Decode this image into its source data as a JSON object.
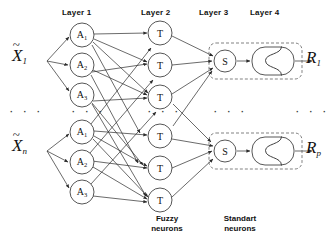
{
  "diagram": {
    "layer_labels": [
      {
        "id": "layer-1",
        "text": "Layer 1",
        "x": 62,
        "y": 8
      },
      {
        "id": "layer-2",
        "text": "Layer 2",
        "x": 141,
        "y": 8
      },
      {
        "id": "layer-3",
        "text": "Layer 3",
        "x": 199,
        "y": 8
      },
      {
        "id": "layer-4",
        "text": "Layer 4",
        "x": 250,
        "y": 8
      }
    ],
    "group_captions": [
      {
        "id": "fuzzy-neurons",
        "line1": "Fuzzy",
        "line2": "neurons",
        "x": 166,
        "y": 216
      },
      {
        "id": "standart-neurons",
        "line1": "Standart",
        "line2": "neurons",
        "x": 239,
        "y": 216
      }
    ],
    "inputs": [
      {
        "id": "input-x1",
        "base": "X",
        "accent": "~",
        "sub": "1",
        "x": 12,
        "y": 46,
        "port_x": 46,
        "port_y": 61
      },
      {
        "id": "input-xn",
        "base": "X",
        "accent": "~",
        "sub": "n",
        "x": 12,
        "y": 136,
        "port_x": 46,
        "port_y": 151
      }
    ],
    "outputs": [
      {
        "id": "output-r1",
        "base": "R",
        "sub": "1",
        "x": 306,
        "y": 48
      },
      {
        "id": "output-rp",
        "base": "R",
        "sub": "p",
        "x": 306,
        "y": 138
      }
    ],
    "layer1_nodes": [
      {
        "id": "a1-top",
        "label": "A",
        "sub": "1",
        "cx": 82,
        "cy": 35,
        "r": 12
      },
      {
        "id": "a2-top",
        "label": "A",
        "sub": "2",
        "cx": 82,
        "cy": 65,
        "r": 12
      },
      {
        "id": "a3-top",
        "label": "A",
        "sub": "3",
        "cx": 82,
        "cy": 95,
        "r": 12
      },
      {
        "id": "a1-bot",
        "label": "A",
        "sub": "1",
        "cx": 82,
        "cy": 132,
        "r": 12
      },
      {
        "id": "a2-bot",
        "label": "A",
        "sub": "2",
        "cx": 82,
        "cy": 162,
        "r": 12
      },
      {
        "id": "a3-bot",
        "label": "A",
        "sub": "3",
        "cx": 82,
        "cy": 192,
        "r": 12
      }
    ],
    "layer2_nodes": [
      {
        "id": "t1-top",
        "label": "T",
        "cx": 160,
        "cy": 33,
        "r": 12
      },
      {
        "id": "t2-top",
        "label": "T",
        "cx": 160,
        "cy": 65,
        "r": 12
      },
      {
        "id": "t3-top",
        "label": "T",
        "cx": 160,
        "cy": 97,
        "r": 12
      },
      {
        "id": "t1-bot",
        "label": "T",
        "cx": 160,
        "cy": 136,
        "r": 12
      },
      {
        "id": "t2-bot",
        "label": "T",
        "cx": 160,
        "cy": 168,
        "r": 12
      },
      {
        "id": "t3-bot",
        "label": "T",
        "cx": 160,
        "cy": 200,
        "r": 12
      }
    ],
    "layer3_nodes": [
      {
        "id": "s-top",
        "label": "S",
        "cx": 225,
        "cy": 61,
        "r": 11
      },
      {
        "id": "s-bot",
        "label": "S",
        "cx": 225,
        "cy": 151,
        "r": 11
      }
    ],
    "layer4_nodes": [
      {
        "id": "sigmoid-top",
        "icon": "sigmoid-curve",
        "x": 252,
        "y": 47,
        "w": 42,
        "h": 28
      },
      {
        "id": "sigmoid-bot",
        "icon": "sigmoid-curve",
        "x": 252,
        "y": 137,
        "w": 42,
        "h": 28
      }
    ],
    "dashed_groups": [
      {
        "id": "standart-group-top",
        "x": 209,
        "y": 43,
        "w": 93,
        "h": 36
      },
      {
        "id": "standart-group-bot",
        "x": 209,
        "y": 133,
        "w": 93,
        "h": 36
      }
    ],
    "ellipses": [
      {
        "id": "ellipsis-inputs",
        "text": "·  ·  ·",
        "x": 10,
        "y": 107
      },
      {
        "id": "ellipsis-layer1",
        "text": "·  ·  ·",
        "x": 72,
        "y": 107
      },
      {
        "id": "ellipsis-layer2",
        "text": "·  ·  ·",
        "x": 148,
        "y": 107
      },
      {
        "id": "ellipsis-layer3",
        "text": "·  ·  ·",
        "x": 214,
        "y": 107
      },
      {
        "id": "ellipsis-outputs",
        "text": "·  ·  ·",
        "x": 296,
        "y": 107
      }
    ],
    "colors": {
      "stroke": "#2b2b2b",
      "node_fill": "#ffffff",
      "dashed": "#4a4a4a",
      "text": "#111111",
      "background": "#ffffff"
    }
  }
}
